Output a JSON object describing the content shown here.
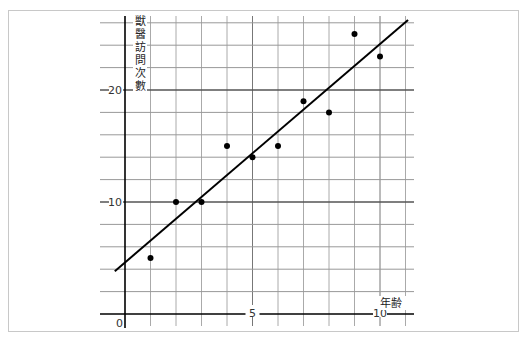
{
  "chart_data": {
    "type": "scatter",
    "title": "",
    "xlabel": "年齢",
    "ylabel": "獣醫訪問次數",
    "xlim": [
      0,
      11
    ],
    "ylim": [
      0,
      26
    ],
    "x_ticks": [
      0,
      5,
      10
    ],
    "x_tick_labels": [
      "0",
      "5",
      "10"
    ],
    "y_ticks": [
      10,
      20
    ],
    "y_tick_labels": [
      "10",
      "20"
    ],
    "grid": true,
    "grid_x_step": 1,
    "grid_y_step": 2,
    "legend": null,
    "series": [
      {
        "name": "visits",
        "type": "scatter",
        "x": [
          1,
          2,
          3,
          4,
          5,
          6,
          7,
          8,
          9,
          10
        ],
        "y": [
          5,
          10,
          10,
          15,
          14,
          15,
          19,
          18,
          25,
          23
        ]
      }
    ],
    "trend_line": {
      "intercept": 4.6,
      "slope": 1.95,
      "x_range": [
        -0.4,
        11.1
      ]
    },
    "colors": {
      "points": "#000000",
      "line": "#000000",
      "grid": "#999999",
      "axis": "#000000",
      "frame": "#c8c8c8"
    }
  }
}
